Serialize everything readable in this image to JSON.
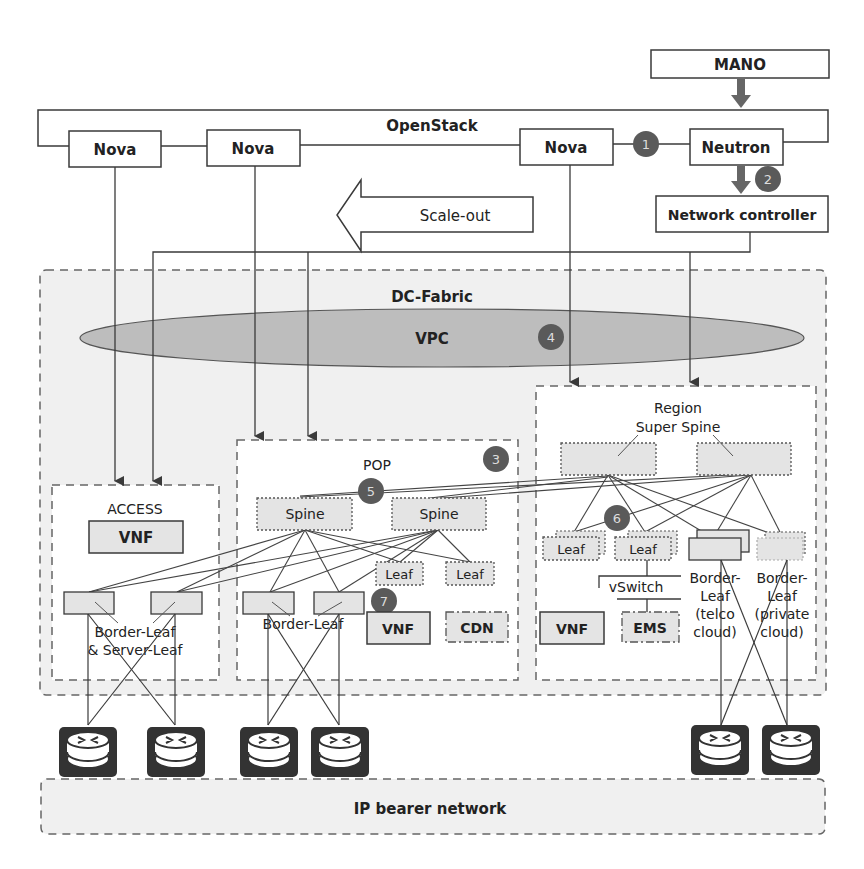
{
  "diagram": {
    "mano": {
      "label": "MANO"
    },
    "openstack": {
      "label": "OpenStack",
      "nova_1": "Nova",
      "nova_2": "Nova",
      "nova_3": "Nova",
      "neutron": "Neutron"
    },
    "network_controller": {
      "label": "Network controller"
    },
    "scale_out": {
      "label": "Scale-out"
    },
    "dc_fabric": {
      "label": "DC-Fabric",
      "vpc": "VPC"
    },
    "access": {
      "title": "ACCESS",
      "vnf": "VNF",
      "leaf_label_1": "Border-Leaf",
      "leaf_label_2": "& Server-Leaf"
    },
    "pop": {
      "title": "POP",
      "spine_1": "Spine",
      "spine_2": "Spine",
      "leaf_1": "Leaf",
      "leaf_2": "Leaf",
      "border_leaf": "Border-Leaf",
      "vnf": "VNF",
      "cdn": "CDN"
    },
    "region": {
      "title_1": "Region",
      "title_2": "Super Spine",
      "leaf_1": "Leaf",
      "leaf_2": "Leaf",
      "vswitch": "vSwitch",
      "vnf": "VNF",
      "ems": "EMS",
      "border_telco": [
        "Border-",
        "Leaf",
        "(telco",
        "cloud)"
      ],
      "border_private": [
        "Border-",
        "Leaf",
        "(private",
        "cloud)"
      ]
    },
    "ip_bearer": {
      "label": "IP bearer network"
    },
    "badges": [
      "1",
      "2",
      "3",
      "4",
      "5",
      "6",
      "7"
    ],
    "colors": {
      "line": "#3a3a3a",
      "badge": "#5a5a5a",
      "region_fill": "#f0f0f0",
      "node_fill": "#e4e4e4",
      "vpc_fill": "#bdbdbd",
      "router_fill": "#333333"
    }
  }
}
